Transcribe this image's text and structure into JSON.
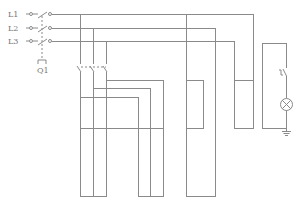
{
  "diagram": {
    "type": "electrical-schematic",
    "line_color": "#8a8a8a",
    "background": "#ffffff",
    "phases": [
      {
        "label": "L1",
        "y": 14
      },
      {
        "label": "L2",
        "y": 28
      },
      {
        "label": "L3",
        "y": 41
      }
    ],
    "main_switch": {
      "label": "Q1"
    },
    "components": [
      {
        "name": "three-pole-breaker",
        "label": "Q1"
      },
      {
        "name": "three-pole-contactor",
        "label": ""
      },
      {
        "name": "control-switch",
        "label": ""
      },
      {
        "name": "indicator-lamp",
        "label": ""
      },
      {
        "name": "ground",
        "label": ""
      }
    ]
  }
}
